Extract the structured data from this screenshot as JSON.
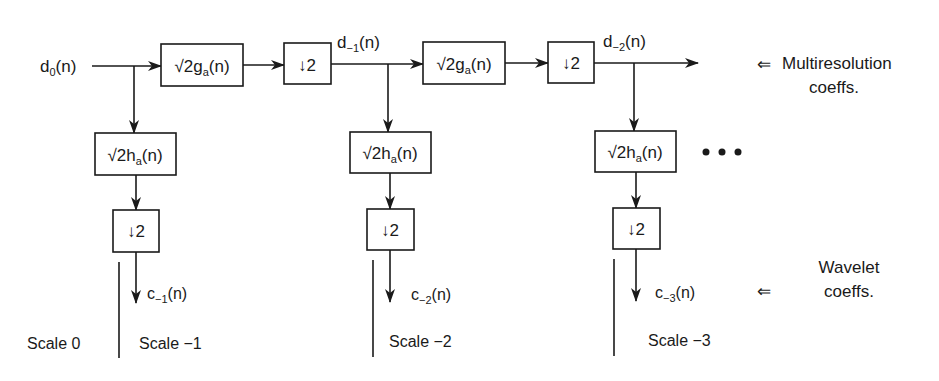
{
  "diagram": {
    "type": "wavelet-filter-bank",
    "colors": {
      "ink": "#1a1a1a",
      "background": "#ffffff"
    },
    "input": {
      "label_main": "d",
      "label_sub": "0",
      "label_suffix": "(n)"
    },
    "stages": [
      {
        "lowpass_box": {
          "prefix": "√2g",
          "sub": "a",
          "suffix": "(n)"
        },
        "lowpass_down": "↓2",
        "highpass_box": {
          "prefix": "√2h",
          "sub": "a",
          "suffix": "(n)"
        },
        "highpass_down": "↓2",
        "multires_out": {
          "main": "d",
          "sub": "−1",
          "suffix": "(n)"
        },
        "wavelet_out": {
          "main": "c",
          "sub": "−1",
          "suffix": "(n)"
        },
        "scale_label": "Scale −1"
      },
      {
        "lowpass_box": {
          "prefix": "√2g",
          "sub": "a",
          "suffix": "(n)"
        },
        "lowpass_down": "↓2",
        "highpass_box": {
          "prefix": "√2h",
          "sub": "a",
          "suffix": "(n)"
        },
        "highpass_down": "↓2",
        "multires_out": {
          "main": "d",
          "sub": "−2",
          "suffix": "(n)"
        },
        "wavelet_out": {
          "main": "c",
          "sub": "−2",
          "suffix": "(n)"
        },
        "scale_label": "Scale −2"
      },
      {
        "highpass_box": {
          "prefix": "√2h",
          "sub": "a",
          "suffix": "(n)"
        },
        "highpass_down": "↓2",
        "wavelet_out": {
          "main": "c",
          "sub": "−3",
          "suffix": "(n)"
        },
        "scale_label": "Scale −3"
      }
    ],
    "scale0_label": "Scale 0",
    "ellipsis": "• • •",
    "legend": {
      "multires_arrow": "⇐",
      "multires_line1": "Multiresolution",
      "multires_line2": "coeffs.",
      "wavelet_arrow": "⇐",
      "wavelet_line1": "Wavelet",
      "wavelet_line2": "coeffs."
    }
  }
}
